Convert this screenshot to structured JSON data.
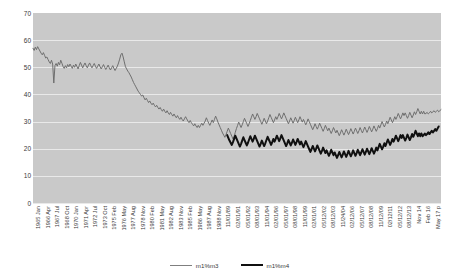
{
  "chart_data": {
    "type": "line",
    "title": "",
    "xlabel": "",
    "ylabel": "",
    "ylim": [
      0,
      70
    ],
    "ytick_values": [
      70,
      60,
      50,
      40,
      30,
      20,
      10,
      0
    ],
    "grid": true,
    "legend_position": "bottom-center",
    "plot_background": "#c9c9c9",
    "gridline_color": "#e9e9e9",
    "xtick_labels": [
      "1965 Jan",
      "1966 Apr",
      "1967 Jul",
      "1968 Oct",
      "1970 Jan",
      "1971 Apr",
      "1972 Jul",
      "1973 Oct",
      "1975 Feb",
      "1976 May",
      "1977 Aug",
      "1978 Nov",
      "1980 Feb",
      "1981 May",
      "1982 Aug",
      "1983 Nov",
      "1985 Feb",
      "1986 May",
      "1987 Aug",
      "1988 Nov",
      "11/01/89",
      "02/01/91",
      "05/01/92",
      "08/01/93",
      "11/01/94",
      "02/01/96",
      "05/01/97",
      "08/01/98",
      "11/01/99",
      "02/01/01",
      "05/12/02",
      "08/12/03",
      "11/24/04",
      "02/12/06",
      "05/12/07",
      "08/12/08",
      "11/12/09",
      "02/12/11",
      "05/12/12",
      "08/12/13",
      "Nov 14",
      "Feb 16",
      "May 17 p"
    ],
    "series": [
      {
        "name": "m1%m3",
        "color": "#6e6e6e",
        "width": 1,
        "start_index": 0,
        "values": [
          57.0,
          56.2,
          57.4,
          56.5,
          57.6,
          56.8,
          56.0,
          55.2,
          54.6,
          55.4,
          54.4,
          53.4,
          53.8,
          52.9,
          52.0,
          51.4,
          52.6,
          51.2,
          44.2,
          50.6,
          51.4,
          50.4,
          51.8,
          50.9,
          52.6,
          51.5,
          50.3,
          49.6,
          50.6,
          49.8,
          51.0,
          50.2,
          51.2,
          50.4,
          49.6,
          50.8,
          50.0,
          51.2,
          50.3,
          49.4,
          50.6,
          51.8,
          50.8,
          49.8,
          50.8,
          51.6,
          50.6,
          49.8,
          50.8,
          51.6,
          50.6,
          49.8,
          50.6,
          51.4,
          50.4,
          49.6,
          50.4,
          51.2,
          50.2,
          49.4,
          50.2,
          51.0,
          50.0,
          49.2,
          50.0,
          50.8,
          49.8,
          49.0,
          49.8,
          50.6,
          49.6,
          48.8,
          49.6,
          50.4,
          51.6,
          53.0,
          54.6,
          55.2,
          53.8,
          52.0,
          50.2,
          49.4,
          48.6,
          48.0,
          47.2,
          46.4,
          45.4,
          44.4,
          43.6,
          42.8,
          42.0,
          41.2,
          40.6,
          40.0,
          39.4,
          39.8,
          38.8,
          38.0,
          38.6,
          37.8,
          37.0,
          37.6,
          36.8,
          36.2,
          36.8,
          36.0,
          35.4,
          36.0,
          35.2,
          34.6,
          35.2,
          34.4,
          33.8,
          34.6,
          33.8,
          33.2,
          34.0,
          33.2,
          32.6,
          33.4,
          32.6,
          32.0,
          32.8,
          32.0,
          31.4,
          32.2,
          31.4,
          30.8,
          31.6,
          30.8,
          30.2,
          31.0,
          31.8,
          31.0,
          30.2,
          29.6,
          30.4,
          29.6,
          29.0,
          28.4,
          29.2,
          28.4,
          27.8,
          28.6,
          27.8,
          28.6,
          29.4,
          28.6,
          29.4,
          30.2,
          31.4,
          30.4,
          29.4,
          28.6,
          29.6,
          30.6,
          29.6,
          30.8,
          32.0,
          31.0,
          29.8,
          28.8,
          27.8,
          26.8,
          25.8,
          25.0,
          24.2,
          25.2,
          26.4,
          27.6,
          26.6,
          25.6,
          24.6,
          23.6,
          24.6,
          26.0,
          27.4,
          28.6,
          29.8,
          28.8,
          27.8,
          28.8,
          30.0,
          31.2,
          30.2,
          29.2,
          28.2,
          29.2,
          30.4,
          31.6,
          32.8,
          31.8,
          30.8,
          31.8,
          33.0,
          32.0,
          31.0,
          30.0,
          29.0,
          30.0,
          31.2,
          30.2,
          29.2,
          30.2,
          31.4,
          32.6,
          31.6,
          30.6,
          29.6,
          30.6,
          31.8,
          30.8,
          31.8,
          33.0,
          32.0,
          31.0,
          32.0,
          33.2,
          32.2,
          31.2,
          30.2,
          29.2,
          30.2,
          31.4,
          30.4,
          29.4,
          30.4,
          31.6,
          30.6,
          29.6,
          30.6,
          31.8,
          30.8,
          29.8,
          30.8,
          29.8,
          28.8,
          29.8,
          31.0,
          30.0,
          29.0,
          28.0,
          27.0,
          28.0,
          29.2,
          28.2,
          27.2,
          28.2,
          29.4,
          28.4,
          27.4,
          26.4,
          27.4,
          28.6,
          27.6,
          26.6,
          27.6,
          26.6,
          25.6,
          26.6,
          27.8,
          26.8,
          25.8,
          26.8,
          25.8,
          24.8,
          25.8,
          27.0,
          26.0,
          25.0,
          26.0,
          27.2,
          26.2,
          25.2,
          26.2,
          27.4,
          26.4,
          25.4,
          26.4,
          27.6,
          26.6,
          25.6,
          26.6,
          27.8,
          26.8,
          25.8,
          26.8,
          28.0,
          27.0,
          26.0,
          27.0,
          28.2,
          27.2,
          26.2,
          27.2,
          28.4,
          27.4,
          26.4,
          27.4,
          28.6,
          27.6,
          28.8,
          30.0,
          29.0,
          28.0,
          29.0,
          30.2,
          29.2,
          30.4,
          31.6,
          30.6,
          29.6,
          30.6,
          31.8,
          30.8,
          31.8,
          33.0,
          32.0,
          31.0,
          32.0,
          33.2,
          32.2,
          33.2,
          32.2,
          31.2,
          32.2,
          33.4,
          32.4,
          31.4,
          32.4,
          33.6,
          32.6,
          33.6,
          34.8,
          33.8,
          32.8,
          33.8,
          32.8,
          33.8,
          32.8,
          33.0,
          33.4,
          32.8,
          33.2,
          33.8,
          33.2,
          33.6,
          34.0,
          33.4,
          33.8,
          34.2,
          33.6,
          34.0,
          34.4
        ]
      },
      {
        "name": "m1%m4",
        "color": "#101010",
        "width": 2,
        "start_index": 168,
        "values": [
          25.0,
          24.0,
          23.0,
          22.2,
          21.4,
          22.4,
          23.6,
          24.8,
          23.8,
          22.8,
          21.8,
          20.8,
          21.8,
          23.0,
          24.2,
          23.2,
          22.2,
          21.2,
          22.2,
          23.4,
          24.6,
          23.6,
          22.6,
          23.6,
          24.8,
          23.8,
          22.8,
          21.8,
          20.8,
          21.8,
          23.0,
          22.0,
          21.0,
          22.0,
          23.2,
          24.4,
          23.4,
          22.4,
          21.4,
          22.4,
          23.6,
          22.6,
          23.6,
          24.8,
          23.8,
          22.8,
          23.8,
          25.0,
          24.0,
          23.0,
          22.0,
          21.0,
          22.0,
          23.2,
          22.2,
          21.2,
          22.2,
          23.4,
          22.4,
          21.4,
          22.4,
          23.6,
          22.6,
          21.6,
          22.6,
          21.6,
          20.6,
          21.6,
          22.8,
          21.8,
          20.8,
          19.8,
          18.8,
          19.8,
          21.0,
          20.0,
          19.0,
          20.0,
          21.2,
          20.2,
          19.2,
          18.2,
          19.2,
          20.4,
          19.4,
          18.4,
          19.4,
          18.4,
          17.4,
          18.4,
          19.6,
          18.6,
          17.6,
          18.6,
          17.6,
          16.6,
          17.6,
          18.8,
          17.8,
          16.8,
          17.8,
          19.0,
          18.0,
          17.0,
          18.0,
          19.2,
          18.2,
          17.2,
          18.2,
          19.4,
          18.4,
          17.4,
          18.4,
          19.6,
          18.6,
          17.6,
          18.6,
          19.8,
          18.8,
          17.8,
          18.8,
          20.0,
          19.0,
          18.0,
          19.0,
          20.2,
          19.2,
          18.2,
          19.2,
          20.4,
          19.4,
          20.6,
          21.8,
          20.8,
          19.8,
          20.8,
          22.0,
          21.0,
          22.2,
          23.4,
          22.4,
          21.4,
          22.4,
          23.6,
          22.6,
          23.6,
          24.8,
          23.8,
          22.8,
          23.8,
          25.0,
          24.0,
          25.0,
          24.0,
          23.0,
          24.0,
          25.2,
          24.2,
          23.2,
          24.2,
          25.4,
          24.4,
          25.4,
          26.6,
          25.6,
          24.6,
          25.6,
          24.6,
          25.6,
          24.6,
          25.0,
          25.6,
          25.0,
          25.4,
          26.0,
          25.4,
          26.0,
          26.6,
          26.0,
          26.6,
          27.2,
          26.6,
          27.4,
          28.2
        ]
      }
    ]
  },
  "legend": {
    "entries": [
      {
        "label": "m1%m3"
      },
      {
        "label": "m1%m4"
      }
    ]
  }
}
